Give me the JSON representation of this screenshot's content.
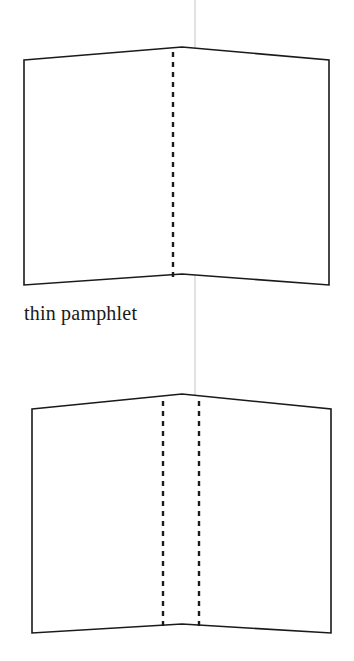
{
  "figure": {
    "caption": "thin pamphlet",
    "background_color": "#ffffff",
    "outline_color": "#1a1a1a",
    "dash_color": "#1a1a1a",
    "guide_color": "#cfcfcf",
    "diagrams": [
      {
        "name": "thin-pamphlet-open-booklet-top",
        "outline_points": "24,60 182,47 329,60 329,285 182,274 24,285",
        "fold_lines": [
          {
            "name": "center-fold-dashed",
            "x": 173,
            "y1": 52,
            "y2": 278
          }
        ]
      },
      {
        "name": "thick-pamphlet-open-booklet-bottom",
        "outline_points": "32,409 182,394 331,409 331,633 182,624 32,633",
        "fold_lines": [
          {
            "name": "left-fold-dashed",
            "x": 163,
            "y1": 401,
            "y2": 628
          },
          {
            "name": "right-fold-dashed",
            "x": 199,
            "y1": 401,
            "y2": 628
          }
        ]
      }
    ],
    "guide_line": {
      "name": "vertical-guide-line",
      "x": 195,
      "y1": 0,
      "y2": 483
    }
  }
}
